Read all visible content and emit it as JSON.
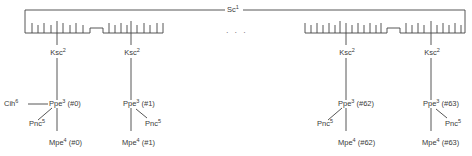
{
  "diagram": {
    "root": {
      "name": "Sc",
      "sup": "1"
    },
    "ellipsis": "· · ·",
    "units": [
      {
        "ksc": {
          "name": "Ksc",
          "sup": "2"
        },
        "ppe": {
          "name": "Ppe",
          "sup": "3",
          "index": "(#0)"
        },
        "mpe": {
          "name": "Mpe",
          "sup": "4",
          "index": "(#0)"
        },
        "pnc": {
          "name": "Pnc",
          "sup": "5",
          "side": "left"
        },
        "cih": {
          "name": "Cih",
          "sup": "6"
        }
      },
      {
        "ksc": {
          "name": "Ksc",
          "sup": "2"
        },
        "ppe": {
          "name": "Ppe",
          "sup": "3",
          "index": "(#1)"
        },
        "mpe": {
          "name": "Mpe",
          "sup": "4",
          "index": "(#1)"
        },
        "pnc": {
          "name": "Pnc",
          "sup": "5",
          "side": "right"
        }
      },
      {
        "ksc": {
          "name": "Ksc",
          "sup": "2"
        },
        "ppe": {
          "name": "Ppe",
          "sup": "3",
          "index": "(#62)"
        },
        "mpe": {
          "name": "Mpe",
          "sup": "4",
          "index": "(#62)"
        },
        "pnc": {
          "name": "Pnc",
          "sup": "5",
          "side": "left"
        }
      },
      {
        "ksc": {
          "name": "Ksc",
          "sup": "2"
        },
        "ppe": {
          "name": "Ppe",
          "sup": "3",
          "index": "(#63)"
        },
        "mpe": {
          "name": "Mpe",
          "sup": "4",
          "index": "(#63)"
        },
        "pnc": {
          "name": "Pnc",
          "sup": "5",
          "side": "right"
        }
      }
    ],
    "line_color": "#444444"
  }
}
